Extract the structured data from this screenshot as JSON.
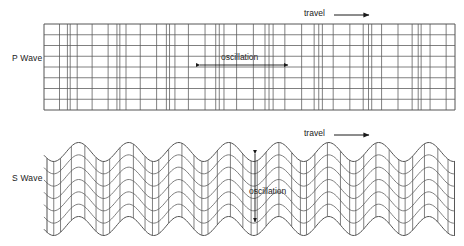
{
  "figure": {
    "background_color": "#ffffff",
    "line_color": "#555555",
    "text_color": "#1a1a1a"
  },
  "p_wave": {
    "label": "P Wave",
    "travel_label": "travel",
    "travel_arrow": "arrow-right-icon",
    "oscillation_label": "oscillation",
    "oscillation_arrow": "double-arrow-horizontal-icon",
    "grid": {
      "left": 44,
      "right": 455,
      "top": 24,
      "bottom": 110,
      "rows": 8,
      "wavelength": 50.0,
      "base_spacing": 9.8,
      "compression_amplitude": 0.62,
      "phase": 0.0
    }
  },
  "s_wave": {
    "label": "S Wave",
    "travel_label": "travel",
    "travel_arrow": "arrow-right-icon",
    "oscillation_label": "oscillation",
    "oscillation_arrow": "double-arrow-vertical-icon",
    "grid": {
      "left": 44,
      "right": 455,
      "top": 152,
      "bottom": 226,
      "rows": 6,
      "columns": 42,
      "wavelength": 50.0,
      "amplitude": 9.5,
      "phase": 0.35
    }
  },
  "chart_data": {
    "type": "line",
    "xlabel": "",
    "ylabel": "",
    "series": [
      {
        "name": "P Wave (compressional / longitudinal)",
        "description": "Rectangular grid whose vertical lines bunch and spread, showing compressions and rarefactions travelling to the right.",
        "oscillation_direction": "horizontal",
        "travel_direction": "right",
        "wavelength_px": 50.0,
        "cycles_visible": 8.2
      },
      {
        "name": "S Wave (shear / transverse)",
        "description": "Sinusoidally deformed grid; particles oscillate vertically while the wave travels to the right.",
        "oscillation_direction": "vertical",
        "travel_direction": "right",
        "wavelength_px": 50.0,
        "amplitude_px": 9.5,
        "cycles_visible": 8.2
      }
    ],
    "legend_position": "left",
    "grid": true
  }
}
